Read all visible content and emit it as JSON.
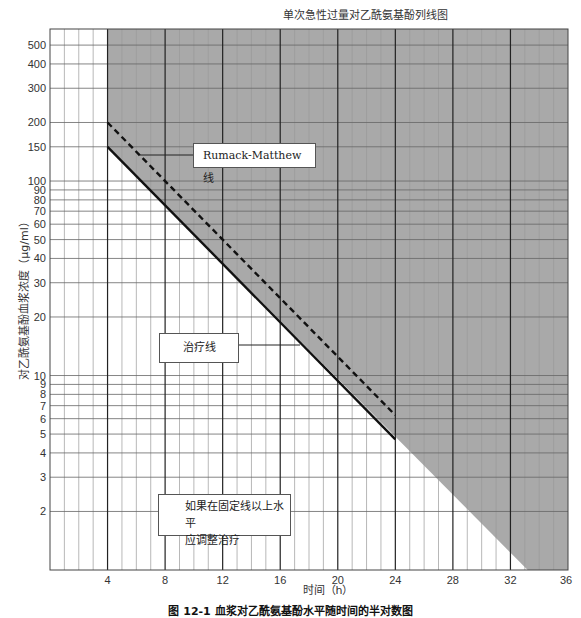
{
  "chart_data": {
    "type": "line",
    "title": "单次急性过量对乙酰氨基酚列线图",
    "xlabel": "时间（h）",
    "ylabel": "对乙酰氨基酚血浆浓度（μg/ml）",
    "caption": "图 12-1  血浆对乙酰氨基酚水平随时间的半对数图",
    "x_scale": "linear",
    "y_scale": "log",
    "xlim": [
      0,
      36
    ],
    "ylim": [
      1,
      605
    ],
    "x_ticks": [
      4,
      8,
      12,
      16,
      20,
      24,
      28,
      32,
      36
    ],
    "y_ticks": [
      2,
      3,
      4,
      5,
      6,
      7,
      8,
      9,
      10,
      20,
      30,
      40,
      50,
      60,
      70,
      80,
      90,
      100,
      150,
      200,
      300,
      400,
      500
    ],
    "grid": true,
    "series": [
      {
        "name": "Rumack-Matthew 线",
        "style": "dashed",
        "color": "#111111",
        "x": [
          4,
          24
        ],
        "y": [
          200,
          6.25
        ]
      },
      {
        "name": "治疗线",
        "style": "solid",
        "color": "#111111",
        "x": [
          4,
          24
        ],
        "y": [
          150,
          4.7
        ]
      }
    ],
    "shaded_region": {
      "description": "Area above treatment line (treatment indicated)",
      "color": "#a9a9a9",
      "boundary_x": [
        4,
        33.2
      ],
      "boundary_y": [
        150,
        1
      ]
    },
    "annotations": [
      {
        "text": "Rumack-Matthew 线",
        "points_to": "dashed line"
      },
      {
        "text": "治疗线",
        "points_to": "solid line"
      },
      {
        "text": "如果在固定线以上水平\n应调整治疗",
        "points_to": ""
      }
    ]
  },
  "labels": {
    "title": "单次急性过量对乙酰氨基酚列线图",
    "ylabel": "对乙酰氨基酚血浆浓度（μg/ml）",
    "xlabel": "时间（h）",
    "caption": "图 12-1  血浆对乙酰氨基酚水平随时间的半对数图",
    "rm_line": "Rumack-Matthew 线",
    "treat_line": "治疗线",
    "note_line1": "如果在固定线以上水平",
    "note_line2": "应调整治疗"
  }
}
